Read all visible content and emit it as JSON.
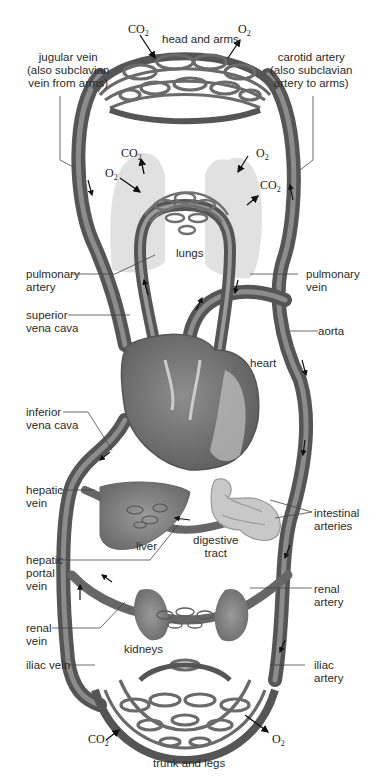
{
  "diagram": {
    "colors": {
      "vessel": "#6e6e6e",
      "vessel_dark": "#4a4a4a",
      "vessel_light": "#9a9a9a",
      "organ": "#8a8a8a",
      "lung": "#d9d9d9",
      "background": "#ffffff",
      "leader_line": "#444444"
    },
    "regions": {
      "head_and_arms": "head and arms",
      "lungs": "lungs",
      "heart": "heart",
      "liver": "liver",
      "digestive_tract": [
        "digestive",
        "tract"
      ],
      "kidneys": "kidneys",
      "trunk_and_legs": "trunk and legs"
    },
    "labels_left": {
      "jugular_vein": [
        "jugular vein",
        "(also subclavian",
        "vein from arms)"
      ],
      "pulmonary_artery": [
        "pulmonary",
        "artery"
      ],
      "superior_vena_cava": [
        "superior",
        "vena cava"
      ],
      "inferior_vena_cava": [
        "inferior",
        "vena cava"
      ],
      "hepatic_vein": [
        "hepatic",
        "vein"
      ],
      "hepatic_portal_vein": [
        "hepatic",
        "portal",
        "vein"
      ],
      "renal_vein": [
        "renal",
        "vein"
      ],
      "iliac_vein": "iliac vein"
    },
    "labels_right": {
      "carotid_artery": [
        "carotid artery",
        "(also subclavian",
        "artery to arms)"
      ],
      "pulmonary_vein": [
        "pulmonary",
        "vein"
      ],
      "aorta": "aorta",
      "intestinal_arteries": [
        "intestinal",
        "arteries"
      ],
      "renal_artery": [
        "renal",
        "artery"
      ],
      "iliac_artery": [
        "iliac",
        "artery"
      ]
    },
    "gas_exchange": {
      "co2": "CO",
      "o2": "O",
      "subscript": "2",
      "head_arms": [
        "CO2 (in)",
        "O2 (out)"
      ],
      "lungs": [
        "CO2 (out)",
        "O2 (in)",
        "O2 (in)",
        "CO2 (out)"
      ],
      "trunk_legs": [
        "CO2 (in)",
        "O2 (out)"
      ]
    }
  }
}
